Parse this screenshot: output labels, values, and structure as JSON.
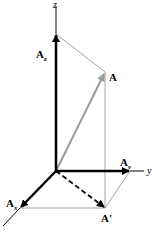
{
  "diagram": {
    "axes": {
      "z": "z",
      "y": "y"
    },
    "labels": {
      "A_main": "A",
      "A_z_main": "A",
      "A_z_sub": "z",
      "A_y_main": "A",
      "A_y_sub": "y",
      "A_x_main": "A",
      "A_x_sub": "x",
      "A_prime": "A'"
    },
    "colors": {
      "axis": "#000000",
      "component": "#000000",
      "vector_A": "#9a9a9a",
      "construction": "#8c8c8c"
    }
  }
}
